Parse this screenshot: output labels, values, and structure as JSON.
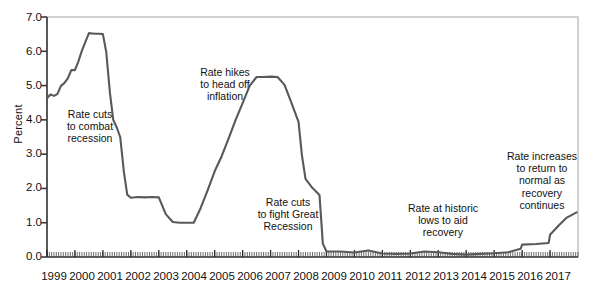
{
  "chart_data": {
    "type": "line",
    "title": "",
    "xlabel": "",
    "ylabel": "Percent",
    "ylim": [
      0.0,
      7.0
    ],
    "xlim": [
      1999.0,
      2018.0
    ],
    "grid": false,
    "legend": "none",
    "y_ticks": [
      "0.0",
      "1.0",
      "2.0",
      "3.0",
      "4.0",
      "5.0",
      "6.0",
      "7.0"
    ],
    "y_tick_values": [
      0.0,
      1.0,
      2.0,
      3.0,
      4.0,
      5.0,
      6.0,
      7.0
    ],
    "x_ticks": [
      "1999",
      "2000",
      "2001",
      "2002",
      "2003",
      "2004",
      "2005",
      "2006",
      "2007",
      "2008",
      "2009",
      "2010",
      "2011",
      "2012",
      "2013",
      "2014",
      "2015",
      "2016",
      "2017"
    ],
    "x_tick_values": [
      1999,
      2000,
      2001,
      2002,
      2003,
      2004,
      2005,
      2006,
      2007,
      2008,
      2009,
      2010,
      2011,
      2012,
      2013,
      2014,
      2015,
      2016,
      2017
    ],
    "minor_ticks": "monthly",
    "series": [
      {
        "name": "Federal funds rate",
        "color": "#595959",
        "x": [
          1999.0,
          1999.12,
          1999.25,
          1999.37,
          1999.5,
          1999.62,
          1999.75,
          1999.87,
          2000.0,
          2000.12,
          2000.25,
          2000.37,
          2000.5,
          2000.62,
          2000.75,
          2000.87,
          2001.0,
          2001.12,
          2001.25,
          2001.37,
          2001.5,
          2001.62,
          2001.75,
          2001.87,
          2002.0,
          2002.25,
          2002.5,
          2002.75,
          2003.0,
          2003.25,
          2003.5,
          2003.75,
          2004.0,
          2004.25,
          2004.5,
          2004.75,
          2005.0,
          2005.25,
          2005.5,
          2005.75,
          2006.0,
          2006.25,
          2006.5,
          2006.75,
          2007.0,
          2007.25,
          2007.5,
          2007.75,
          2008.0,
          2008.12,
          2008.25,
          2008.5,
          2008.75,
          2008.87,
          2009.0,
          2009.5,
          2010.0,
          2010.5,
          2011.0,
          2011.5,
          2012.0,
          2012.5,
          2013.0,
          2013.5,
          2014.0,
          2014.5,
          2015.0,
          2015.5,
          2015.95,
          2016.0,
          2016.5,
          2016.95,
          2017.0,
          2017.3,
          2017.6,
          2017.95
        ],
        "y": [
          4.63,
          4.74,
          4.7,
          4.75,
          4.99,
          5.07,
          5.22,
          5.45,
          5.45,
          5.7,
          6.02,
          6.27,
          6.53,
          6.52,
          6.51,
          6.51,
          6.5,
          5.98,
          4.8,
          4.0,
          3.77,
          3.5,
          2.49,
          1.82,
          1.73,
          1.75,
          1.74,
          1.75,
          1.74,
          1.25,
          1.02,
          1.0,
          1.0,
          1.0,
          1.43,
          1.95,
          2.5,
          2.94,
          3.46,
          4.0,
          4.49,
          4.99,
          5.25,
          5.25,
          5.26,
          5.25,
          5.02,
          4.49,
          3.94,
          2.98,
          2.28,
          2.01,
          1.81,
          0.39,
          0.16,
          0.16,
          0.13,
          0.19,
          0.1,
          0.09,
          0.1,
          0.16,
          0.14,
          0.09,
          0.07,
          0.09,
          0.11,
          0.14,
          0.24,
          0.36,
          0.38,
          0.41,
          0.65,
          0.91,
          1.15,
          1.3
        ]
      }
    ],
    "annotations": [
      {
        "id": "annot-rate-cuts-recession",
        "text": "Rate cuts\nto combat\nrecession"
      },
      {
        "id": "annot-rate-hikes-inflation",
        "text": "Rate hikes\nto head off\ninflation"
      },
      {
        "id": "annot-rate-cuts-great-recession",
        "text": "Rate cuts\nto fight Great\nRecession"
      },
      {
        "id": "annot-historic-lows",
        "text": "Rate at historic\nlows to aid\nrecovery"
      },
      {
        "id": "annot-rate-increases-normal",
        "text": "Rate increases\nto return to\nnormal as\nrecovery\ncontinues"
      }
    ]
  },
  "colors": {
    "line": "#595959",
    "axis": "#3a3a3a",
    "frame": "#9a9a9a",
    "text": "#111111",
    "background": "#ffffff"
  }
}
